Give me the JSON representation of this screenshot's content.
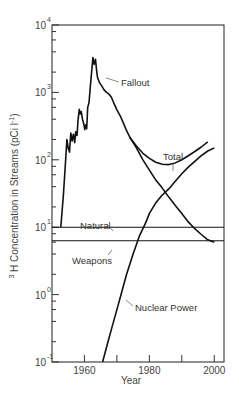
{
  "chart_data": {
    "type": "line",
    "title": "",
    "xlabel": "Year",
    "ylabel": "³H Concentration in Streams (pCi l⁻¹)",
    "ylabel_parts": {
      "sup": "3",
      "main": "H  Concentration  in  Streams  (pCi  l",
      "exp": "-1",
      "close": ")"
    },
    "yscale": "log",
    "xlim": [
      1950,
      2003
    ],
    "ylim": [
      0.1,
      10000
    ],
    "grid": false,
    "legend": "inline labels",
    "x_ticks": [
      1960,
      1970,
      1980,
      1990,
      2000
    ],
    "x_tick_labels": [
      {
        "year": 1960,
        "label": "1960"
      },
      {
        "year": 1980,
        "label": "1980"
      },
      {
        "year": 2000,
        "label": "2000"
      }
    ],
    "y_ticks": [
      {
        "exp": -1,
        "base": "10",
        "sup": "-1"
      },
      {
        "exp": 0,
        "base": "10",
        "sup": "0"
      },
      {
        "exp": 1,
        "base": "10",
        "sup": "1"
      },
      {
        "exp": 2,
        "base": "10",
        "sup": "2"
      },
      {
        "exp": 3,
        "base": "10",
        "sup": "3"
      },
      {
        "exp": 4,
        "base": "10",
        "sup": "4"
      }
    ],
    "series": [
      {
        "name": "Total",
        "points": [
          [
            1952.7,
            10
          ],
          [
            1953.5,
            30
          ],
          [
            1954.3,
            120
          ],
          [
            1954.6,
            200
          ],
          [
            1955.0,
            150
          ],
          [
            1955.4,
            130
          ],
          [
            1955.8,
            250
          ],
          [
            1956.2,
            190
          ],
          [
            1956.6,
            240
          ],
          [
            1957.0,
            180
          ],
          [
            1957.3,
            260
          ],
          [
            1957.7,
            230
          ],
          [
            1958.0,
            380
          ],
          [
            1958.4,
            560
          ],
          [
            1958.7,
            480
          ],
          [
            1959.0,
            520
          ],
          [
            1959.4,
            400
          ],
          [
            1959.8,
            340
          ],
          [
            1960.1,
            280
          ],
          [
            1960.4,
            330
          ],
          [
            1960.7,
            290
          ],
          [
            1961.0,
            600
          ],
          [
            1961.4,
            700
          ],
          [
            1961.8,
            1200
          ],
          [
            1962.2,
            2000
          ],
          [
            1962.6,
            3300
          ],
          [
            1963.0,
            2600
          ],
          [
            1963.4,
            3100
          ],
          [
            1963.7,
            2200
          ],
          [
            1964.0,
            1700
          ],
          [
            1964.6,
            1400
          ],
          [
            1965.3,
            1250
          ],
          [
            1966.0,
            1100
          ],
          [
            1966.8,
            1000
          ],
          [
            1967.5,
            950
          ],
          [
            1968.3,
            850
          ],
          [
            1969.0,
            700
          ],
          [
            1970.0,
            550
          ],
          [
            1971.0,
            450
          ],
          [
            1972.0,
            350
          ],
          [
            1973.0,
            270
          ],
          [
            1974.0,
            215
          ],
          [
            1976.0,
            160
          ],
          [
            1978.0,
            125
          ],
          [
            1980.0,
            105
          ],
          [
            1982.0,
            92
          ],
          [
            1984.0,
            86
          ],
          [
            1986.0,
            85
          ],
          [
            1988.0,
            90
          ],
          [
            1990.0,
            100
          ],
          [
            1992.0,
            115
          ],
          [
            1994.0,
            133
          ],
          [
            1996.0,
            155
          ],
          [
            1998.0,
            185
          ]
        ]
      },
      {
        "name": "Fallout",
        "points": [
          [
            1974.0,
            215
          ],
          [
            1976.0,
            150
          ],
          [
            1978.0,
            100
          ],
          [
            1980.0,
            70
          ],
          [
            1982.0,
            50
          ],
          [
            1984.0,
            38
          ],
          [
            1986.0,
            28
          ],
          [
            1988.0,
            21
          ],
          [
            1990.0,
            16
          ],
          [
            1992.0,
            12
          ],
          [
            1994.0,
            9.5
          ],
          [
            1996.0,
            7.8
          ],
          [
            1998.0,
            6.5
          ],
          [
            2000.0,
            6
          ]
        ]
      },
      {
        "name": "Nuclear Power",
        "points": [
          [
            1965.6,
            0.1
          ],
          [
            1967.0,
            0.18
          ],
          [
            1968.5,
            0.33
          ],
          [
            1970.0,
            0.6
          ],
          [
            1971.5,
            1.1
          ],
          [
            1973.0,
            2
          ],
          [
            1975.0,
            4
          ],
          [
            1977.0,
            7.5
          ],
          [
            1979.0,
            12
          ],
          [
            1980.0,
            16
          ],
          [
            1982.0,
            23
          ],
          [
            1984.0,
            30
          ],
          [
            1986.0,
            37
          ],
          [
            1988.0,
            48
          ],
          [
            1990.0,
            62
          ],
          [
            1992.0,
            78
          ],
          [
            1994.0,
            95
          ],
          [
            1996.0,
            115
          ],
          [
            1998.0,
            135
          ],
          [
            2000.0,
            150
          ]
        ]
      },
      {
        "name": "Natural",
        "points": [
          [
            1950,
            10
          ],
          [
            2003,
            10
          ]
        ]
      },
      {
        "name": "Weapons",
        "points": [
          [
            1950,
            6.3
          ],
          [
            2003,
            6.3
          ]
        ]
      }
    ],
    "annotations": [
      {
        "text": "Fallout",
        "series": "Fallout",
        "x": 121,
        "y": 86,
        "leader": [
          106,
          78,
          119,
          82
        ]
      },
      {
        "text": "Total",
        "series": "Total",
        "x": 163,
        "y": 160,
        "leader": [
          173,
          163,
          173,
          171
        ]
      },
      {
        "text": "Natural",
        "series": "Natural",
        "x": 80,
        "y": 229,
        "leader": [
          107,
          224,
          113,
          231
        ]
      },
      {
        "text": "Weapons",
        "series": "Weapons",
        "x": 72,
        "y": 264,
        "leader": [
          112,
          250,
          108,
          255
        ]
      },
      {
        "text": "Nuclear Power",
        "series": "Nuclear Power",
        "x": 135,
        "y": 311,
        "leader": [
          126,
          300,
          133,
          306
        ]
      }
    ],
    "plot_box": {
      "left": 52,
      "right": 224,
      "top": 25,
      "bottom": 362
    }
  }
}
